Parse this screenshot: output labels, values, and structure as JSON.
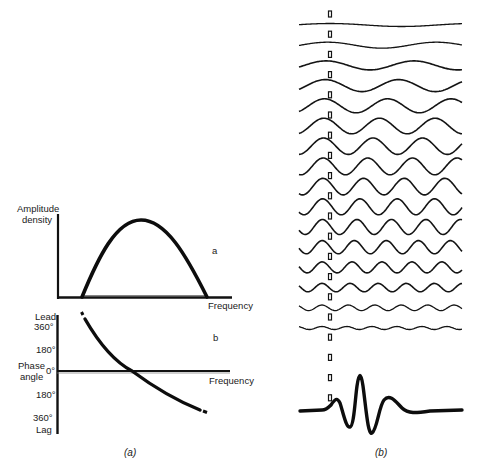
{
  "panel_a": {
    "caption": "(a)",
    "top_plot": {
      "tag": "a",
      "y_label_line1": "Amplitude",
      "y_label_line2": "density",
      "x_label": "Frequency"
    },
    "bottom_plot": {
      "tag": "b",
      "y_top": "Lead",
      "tick_360_top": "360°",
      "tick_180_top": "180°",
      "y_label_line1": "Phase",
      "y_label_line2": "angle",
      "tick_0": "0°",
      "tick_180_bottom": "180°",
      "tick_360_bottom": "360°",
      "y_bottom": "Lag",
      "x_label": "Frequency"
    }
  },
  "panel_b": {
    "caption": "(b)",
    "component_count": 16,
    "description": "Sinusoidal frequency components summing to an impulse (wavelet)"
  },
  "chart_data": [
    {
      "type": "line",
      "title": "a",
      "xlabel": "Frequency",
      "ylabel": "Amplitude density",
      "x": [
        0,
        0.15,
        0.3,
        0.45,
        0.6,
        0.75,
        0.9,
        1.0
      ],
      "values": [
        0,
        0,
        0.55,
        0.92,
        1.0,
        0.8,
        0.3,
        0
      ],
      "note": "band-limited amplitude spectrum (arch between two cutoff frequencies)"
    },
    {
      "type": "line",
      "title": "b",
      "xlabel": "Frequency",
      "ylabel": "Phase angle",
      "yticks": [
        "360° Lead",
        "180°",
        "0°",
        "180°",
        "360° Lag"
      ],
      "x": [
        0.15,
        0.3,
        0.45,
        0.6,
        0.75,
        0.9
      ],
      "values": [
        360,
        180,
        0,
        -120,
        -220,
        -300
      ],
      "note": "phase decreases monotonically from lead to lag"
    }
  ]
}
